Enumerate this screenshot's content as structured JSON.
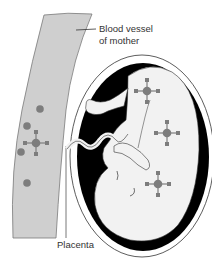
{
  "diagram": {
    "type": "anatomical-illustration",
    "labels": {
      "blood_vessel_line1": "Blood vessel",
      "blood_vessel_line2": "of mother",
      "placenta": "Placenta"
    },
    "colors": {
      "vessel_fill": "#cfcfcf",
      "vessel_outline": "#7a7a7a",
      "cell_dot": "#7d7d7d",
      "molecule": "#7d7d7d",
      "uterus_ring": "#000000",
      "fetus_fill": "#f2f2f2",
      "label_text": "#333333"
    },
    "elements": {
      "maternal_blood_dots": 5,
      "molecules_in_vessel": 1,
      "molecules_in_fetus": 3
    }
  }
}
